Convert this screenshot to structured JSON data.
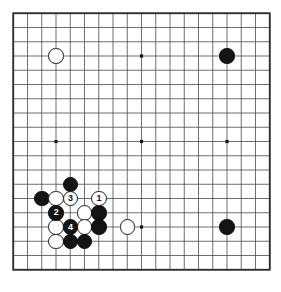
{
  "diagram": {
    "board_size": 19,
    "colors": {
      "background": "#ffffff",
      "board": "#ffffff",
      "grid_line": "#4a4a4a",
      "border_line": "#2b2b2b",
      "black_stone": "#141414",
      "white_stone": "#ffffff",
      "stone_outline": "#1a1a1a",
      "star_point": "#141414"
    },
    "geometry": {
      "origin_x": 13.25,
      "origin_y": 13.25,
      "spacing": 14.25,
      "stone_diameter": 15.5,
      "star_point_size": 3.2,
      "border_width": 1.8,
      "line_width": 0.8
    },
    "star_points": [
      {
        "col": 3,
        "row": 3
      },
      {
        "col": 9,
        "row": 3
      },
      {
        "col": 15,
        "row": 3
      },
      {
        "col": 3,
        "row": 9
      },
      {
        "col": 9,
        "row": 9
      },
      {
        "col": 15,
        "row": 9
      },
      {
        "col": 3,
        "row": 15
      },
      {
        "col": 9,
        "row": 15
      },
      {
        "col": 15,
        "row": 15
      }
    ],
    "stones": [
      {
        "id": "white-upper-left",
        "color": "white",
        "col": 3,
        "row": 3,
        "label": ""
      },
      {
        "id": "black-upper-right",
        "color": "black",
        "col": 15,
        "row": 3,
        "label": ""
      },
      {
        "id": "black-lower-right",
        "color": "black",
        "col": 15,
        "row": 15,
        "label": ""
      },
      {
        "id": "black-c12",
        "color": "black",
        "col": 4,
        "row": 12,
        "label": ""
      },
      {
        "id": "black-c13",
        "color": "black",
        "col": 2,
        "row": 13,
        "label": ""
      },
      {
        "id": "white-c13",
        "color": "white",
        "col": 3,
        "row": 13,
        "label": ""
      },
      {
        "id": "white-move-3",
        "color": "white",
        "col": 4,
        "row": 13,
        "label": "3"
      },
      {
        "id": "white-move-1",
        "color": "white",
        "col": 6,
        "row": 13,
        "label": "1"
      },
      {
        "id": "black-move-2",
        "color": "black",
        "col": 3,
        "row": 14,
        "label": "2"
      },
      {
        "id": "white-d14",
        "color": "white",
        "col": 5,
        "row": 14,
        "label": ""
      },
      {
        "id": "black-d14",
        "color": "black",
        "col": 6,
        "row": 14,
        "label": ""
      },
      {
        "id": "white-c15",
        "color": "white",
        "col": 3,
        "row": 15,
        "label": ""
      },
      {
        "id": "black-move-4",
        "color": "black",
        "col": 4,
        "row": 15,
        "label": "4"
      },
      {
        "id": "white-d15",
        "color": "white",
        "col": 5,
        "row": 15,
        "label": ""
      },
      {
        "id": "black-e15",
        "color": "black",
        "col": 6,
        "row": 15,
        "label": ""
      },
      {
        "id": "white-h15",
        "color": "white",
        "col": 8,
        "row": 15,
        "label": ""
      },
      {
        "id": "white-c16",
        "color": "white",
        "col": 3,
        "row": 16,
        "label": ""
      },
      {
        "id": "black-d16",
        "color": "black",
        "col": 4,
        "row": 16,
        "label": ""
      },
      {
        "id": "black-e16",
        "color": "black",
        "col": 5,
        "row": 16,
        "label": ""
      }
    ],
    "move_sequence": [
      {
        "number": "1",
        "color": "white"
      },
      {
        "number": "2",
        "color": "black"
      },
      {
        "number": "3",
        "color": "white"
      },
      {
        "number": "4",
        "color": "black"
      }
    ]
  }
}
